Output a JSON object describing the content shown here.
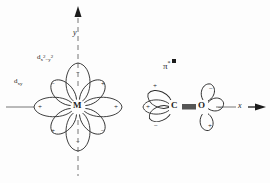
{
  "diagram": {
    "background_color": "#fdfdfd",
    "line_color": "#2b2b2b",
    "axes": {
      "x": {
        "label": "x",
        "style": "dashed-with-arrow",
        "direction": "right",
        "y_px": 107
      },
      "y": {
        "label": "y",
        "style": "dashed-with-arrow",
        "direction": "up",
        "x_px": 78
      }
    },
    "atoms": [
      {
        "name": "metal",
        "label": "M",
        "x": 78,
        "y": 107
      },
      {
        "name": "carbon",
        "label": "C",
        "x": 175,
        "y": 107
      },
      {
        "name": "oxygen",
        "label": "O",
        "x": 202,
        "y": 107
      }
    ],
    "bond": {
      "name": "carbon-oxygen-bond",
      "type": "triple-bond-bar",
      "from": "C",
      "to": "O"
    },
    "orbital_labels": [
      {
        "id": "dx2y2",
        "text_plain": "dx2-y2",
        "x": 38,
        "y": 57
      },
      {
        "id": "dxy",
        "text_plain": "dxy",
        "x": 14,
        "y": 79
      },
      {
        "id": "pistar",
        "text_plain": "pi*",
        "x": 163,
        "y": 62
      }
    ],
    "metal_lobes": [
      {
        "angle_deg": 90,
        "sign": "-"
      },
      {
        "angle_deg": 135,
        "sign": "-"
      },
      {
        "angle_deg": 180,
        "sign": "+"
      },
      {
        "angle_deg": 225,
        "sign": "+"
      },
      {
        "angle_deg": 270,
        "sign": "-"
      },
      {
        "angle_deg": 315,
        "sign": "-"
      },
      {
        "angle_deg": 0,
        "sign": "+"
      },
      {
        "angle_deg": 45,
        "sign": "+"
      }
    ],
    "carbon_lobes": [
      {
        "position": "upper-left",
        "sign": "+"
      },
      {
        "position": "left",
        "sign": "+"
      },
      {
        "position": "lower-left",
        "sign": "-"
      }
    ],
    "oxygen_lobes": [
      {
        "position": "upper",
        "sign": "-"
      },
      {
        "position": "right",
        "sign": "-"
      },
      {
        "position": "lower",
        "sign": "+"
      }
    ],
    "signs": {
      "positive": "+",
      "negative": "−"
    }
  }
}
